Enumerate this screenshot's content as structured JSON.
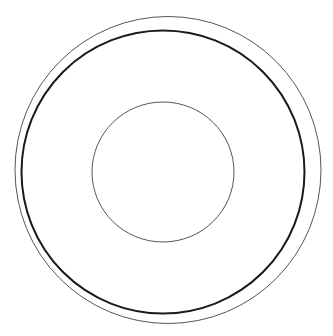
{
  "colors": {
    "background": "#ffffff",
    "outer_ring": "#555555",
    "middle_ring": "#1a1a1a",
    "inner_circle": "#555555"
  },
  "shapes": [
    {
      "name": "outer-circle",
      "kind": "circle",
      "style": "thin"
    },
    {
      "name": "middle-circle",
      "kind": "circle",
      "style": "thick"
    },
    {
      "name": "inner-circle",
      "kind": "circle",
      "style": "thin"
    }
  ]
}
